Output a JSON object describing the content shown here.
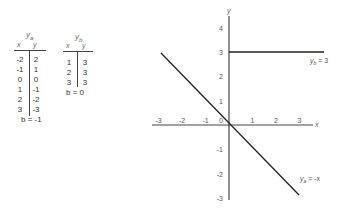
{
  "table_a": {
    "title": "y",
    "title_sub": "a",
    "col_x": "x",
    "col_y": "y",
    "rows": [
      {
        "x": "-2",
        "y": "2"
      },
      {
        "x": "-1",
        "y": "1"
      },
      {
        "x": "0",
        "y": "0"
      },
      {
        "x": "1",
        "y": "-1"
      },
      {
        "x": "2",
        "y": "-2"
      },
      {
        "x": "3",
        "y": "-3"
      }
    ],
    "footer": "b = -1"
  },
  "table_b": {
    "title": "y",
    "title_sub": "b",
    "col_x": "x",
    "col_y": "y",
    "rows": [
      {
        "x": "1",
        "y": "3"
      },
      {
        "x": "2",
        "y": "3"
      },
      {
        "x": "3",
        "y": "3"
      }
    ],
    "footer": "b = 0"
  },
  "graph": {
    "x_axis_label": "x",
    "y_axis_label": "y",
    "x_ticks": [
      "-3",
      "-2",
      "-1",
      "0",
      "1",
      "2",
      "3"
    ],
    "y_ticks_pos": [
      "4",
      "3",
      "2",
      "1"
    ],
    "y_ticks_neg": [
      "-1",
      "-2",
      "-3"
    ],
    "line_b_label": "y_b = 3",
    "line_b_label_main": "y",
    "line_b_label_sub": "b",
    "line_b_label_rest": " = 3",
    "line_a_label_main": "y",
    "line_a_label_sub": "a",
    "line_a_label_rest": " = -x",
    "line_color": "#222222",
    "axis_color": "#444444"
  }
}
